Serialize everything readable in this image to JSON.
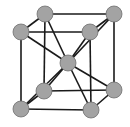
{
  "style": {
    "atom_fill": "#a3a3a3",
    "atom_stroke": "#6e6e6e",
    "bond_color": "#1a1a1a",
    "atom_radius": 8,
    "bond_width": 1.6
  },
  "atoms": [
    {
      "id": "back-top-left",
      "x": 45,
      "y": 14
    },
    {
      "id": "back-top-right",
      "x": 114,
      "y": 14
    },
    {
      "id": "front-top-left",
      "x": 21,
      "y": 32
    },
    {
      "id": "front-top-right",
      "x": 90,
      "y": 32
    },
    {
      "id": "body-center",
      "x": 68,
      "y": 63
    },
    {
      "id": "back-bottom-left",
      "x": 44,
      "y": 91
    },
    {
      "id": "back-bottom-right",
      "x": 114,
      "y": 90
    },
    {
      "id": "front-bottom-left",
      "x": 21,
      "y": 109
    },
    {
      "id": "front-bottom-right",
      "x": 91,
      "y": 110
    }
  ],
  "edges": [
    [
      "back-top-left",
      "back-top-right"
    ],
    [
      "front-top-left",
      "front-top-right"
    ],
    [
      "back-top-left",
      "front-top-left"
    ],
    [
      "back-top-right",
      "front-top-right"
    ],
    [
      "back-bottom-left",
      "back-bottom-right"
    ],
    [
      "front-bottom-left",
      "front-bottom-right"
    ],
    [
      "back-bottom-left",
      "front-bottom-left"
    ],
    [
      "back-bottom-right",
      "front-bottom-right"
    ],
    [
      "back-top-left",
      "back-bottom-left"
    ],
    [
      "back-top-right",
      "back-bottom-right"
    ],
    [
      "front-top-left",
      "front-bottom-left"
    ],
    [
      "front-top-right",
      "front-bottom-right"
    ],
    [
      "body-center",
      "back-top-left"
    ],
    [
      "body-center",
      "back-top-right"
    ],
    [
      "body-center",
      "front-top-left"
    ],
    [
      "body-center",
      "front-top-right"
    ],
    [
      "body-center",
      "back-bottom-left"
    ],
    [
      "body-center",
      "back-bottom-right"
    ],
    [
      "body-center",
      "front-bottom-left"
    ],
    [
      "body-center",
      "front-bottom-right"
    ]
  ]
}
